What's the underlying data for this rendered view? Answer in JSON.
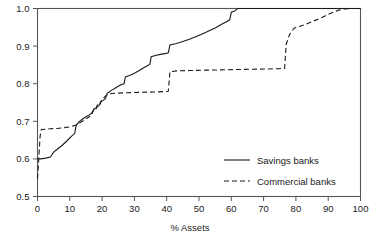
{
  "chart_data": {
    "type": "line",
    "title": "",
    "xlabel": "% Assets",
    "ylabel": "",
    "xlim": [
      0,
      100
    ],
    "ylim": [
      0.5,
      1.0
    ],
    "grid": false,
    "legend_position": "center-right",
    "xticks": [
      0,
      10,
      20,
      30,
      40,
      50,
      60,
      70,
      80,
      90,
      100
    ],
    "xtick_labels": [
      "0",
      "10",
      "20",
      "30",
      "40",
      "50",
      "60",
      "70",
      "80",
      "90",
      "100"
    ],
    "yticks": [
      0.5,
      0.6,
      0.7,
      0.8,
      0.9,
      1.0
    ],
    "ytick_labels": [
      "0.5",
      "0.6",
      "0.7",
      "0.8",
      "0.9",
      "1.0"
    ],
    "series": [
      {
        "name": "Savings banks",
        "style": "solid",
        "color": "#1a1a1a",
        "points": [
          [
            0.0,
            0.6
          ],
          [
            1.0,
            0.6
          ],
          [
            2.5,
            0.602
          ],
          [
            4.0,
            0.605
          ],
          [
            5.0,
            0.618
          ],
          [
            6.0,
            0.625
          ],
          [
            7.5,
            0.635
          ],
          [
            9.0,
            0.647
          ],
          [
            10.5,
            0.66
          ],
          [
            11.5,
            0.668
          ],
          [
            12.0,
            0.69
          ],
          [
            13.0,
            0.7
          ],
          [
            14.0,
            0.706
          ],
          [
            15.0,
            0.712
          ],
          [
            16.0,
            0.717
          ],
          [
            16.8,
            0.722
          ],
          [
            17.5,
            0.733
          ],
          [
            18.2,
            0.736
          ],
          [
            19.0,
            0.742
          ],
          [
            19.6,
            0.752
          ],
          [
            20.2,
            0.755
          ],
          [
            21.0,
            0.76
          ],
          [
            21.6,
            0.775
          ],
          [
            22.2,
            0.778
          ],
          [
            23.0,
            0.783
          ],
          [
            24.0,
            0.788
          ],
          [
            25.0,
            0.793
          ],
          [
            26.0,
            0.798
          ],
          [
            26.8,
            0.8
          ],
          [
            27.2,
            0.818
          ],
          [
            28.5,
            0.822
          ],
          [
            30.0,
            0.828
          ],
          [
            31.5,
            0.835
          ],
          [
            33.0,
            0.843
          ],
          [
            34.0,
            0.848
          ],
          [
            34.8,
            0.852
          ],
          [
            35.2,
            0.872
          ],
          [
            36.5,
            0.875
          ],
          [
            38.0,
            0.878
          ],
          [
            39.5,
            0.88
          ],
          [
            40.5,
            0.882
          ],
          [
            41.0,
            0.903
          ],
          [
            43.0,
            0.907
          ],
          [
            45.0,
            0.912
          ],
          [
            47.0,
            0.918
          ],
          [
            49.0,
            0.925
          ],
          [
            51.0,
            0.932
          ],
          [
            53.0,
            0.94
          ],
          [
            55.0,
            0.948
          ],
          [
            57.0,
            0.958
          ],
          [
            58.5,
            0.965
          ],
          [
            59.5,
            0.97
          ],
          [
            60.0,
            0.99
          ],
          [
            61.0,
            0.993
          ],
          [
            62.0,
            1.0
          ],
          [
            100.0,
            1.0
          ]
        ]
      },
      {
        "name": "Commercial banks",
        "style": "dashed",
        "color": "#1a1a1a",
        "points": [
          [
            0.0,
            0.548
          ],
          [
            0.4,
            0.6
          ],
          [
            0.8,
            0.66
          ],
          [
            1.2,
            0.678
          ],
          [
            2.5,
            0.679
          ],
          [
            4.0,
            0.68
          ],
          [
            6.0,
            0.681
          ],
          [
            8.0,
            0.683
          ],
          [
            10.0,
            0.685
          ],
          [
            12.0,
            0.69
          ],
          [
            13.5,
            0.698
          ],
          [
            15.0,
            0.706
          ],
          [
            16.0,
            0.712
          ],
          [
            16.8,
            0.718
          ],
          [
            17.5,
            0.733
          ],
          [
            18.0,
            0.73
          ],
          [
            18.6,
            0.745
          ],
          [
            19.2,
            0.742
          ],
          [
            19.8,
            0.755
          ],
          [
            20.5,
            0.762
          ],
          [
            21.2,
            0.768
          ],
          [
            21.8,
            0.772
          ],
          [
            23.0,
            0.774
          ],
          [
            25.0,
            0.775
          ],
          [
            28.0,
            0.776
          ],
          [
            32.0,
            0.777
          ],
          [
            36.0,
            0.778
          ],
          [
            39.5,
            0.779
          ],
          [
            40.5,
            0.78
          ],
          [
            41.0,
            0.832
          ],
          [
            43.0,
            0.834
          ],
          [
            47.0,
            0.835
          ],
          [
            52.0,
            0.836
          ],
          [
            58.0,
            0.837
          ],
          [
            64.0,
            0.838
          ],
          [
            70.0,
            0.839
          ],
          [
            75.0,
            0.84
          ],
          [
            76.5,
            0.841
          ],
          [
            77.0,
            0.905
          ],
          [
            78.0,
            0.93
          ],
          [
            79.5,
            0.948
          ],
          [
            81.0,
            0.952
          ],
          [
            83.0,
            0.958
          ],
          [
            85.0,
            0.965
          ],
          [
            87.0,
            0.972
          ],
          [
            89.0,
            0.98
          ],
          [
            91.0,
            0.988
          ],
          [
            93.0,
            0.995
          ],
          [
            95.0,
            0.999
          ],
          [
            97.0,
            1.0
          ],
          [
            100.0,
            1.0
          ]
        ]
      }
    ],
    "legend": [
      {
        "label": "Savings banks",
        "style": "solid"
      },
      {
        "label": "Commercial banks",
        "style": "dashed"
      }
    ]
  }
}
